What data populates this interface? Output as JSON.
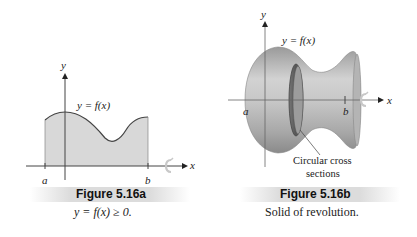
{
  "figure_a": {
    "caption_title": "Figure 5.16a",
    "caption_text": "y = f(x) ≥ 0.",
    "curve_label": "y = f(x)",
    "axis_x_label": "x",
    "axis_y_label": "y",
    "point_a": "a",
    "point_b": "b",
    "fill_color": "#d8d8d8",
    "icon": "rotation-arrow-icon"
  },
  "figure_b": {
    "caption_title": "Figure 5.16b",
    "caption_text": "Solid of revolution.",
    "curve_label": "y = f(x)",
    "axis_x_label": "x",
    "axis_y_label": "y",
    "point_a": "a",
    "point_b": "b",
    "annotation_line1": "Circular cross",
    "annotation_line2": "sections",
    "solid_color": "#bdbdbd",
    "icon": "rotation-arrow-icon"
  }
}
